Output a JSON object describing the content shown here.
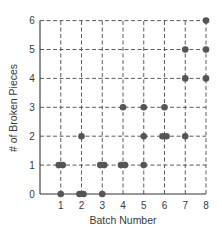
{
  "chart_data": {
    "type": "scatter",
    "title": "",
    "xlabel": "Batch Number",
    "ylabel": "# of Broken Pieces",
    "x_ticks": [
      1,
      2,
      3,
      4,
      5,
      6,
      7,
      8
    ],
    "y_ticks": [
      0,
      1,
      2,
      3,
      4,
      5,
      6
    ],
    "xlim": [
      0,
      8
    ],
    "ylim": [
      0,
      6
    ],
    "grid": true,
    "grid_style": "dashed",
    "legend": null,
    "marker_color": "#555555",
    "series": [
      {
        "name": "Broken pieces per trial",
        "points": [
          {
            "x": 1,
            "y": 0
          },
          {
            "x": 1,
            "y": 1
          },
          {
            "x": 1,
            "y": 1
          },
          {
            "x": 2,
            "y": 0
          },
          {
            "x": 2,
            "y": 0
          },
          {
            "x": 2,
            "y": 2
          },
          {
            "x": 3,
            "y": 0
          },
          {
            "x": 3,
            "y": 1
          },
          {
            "x": 3,
            "y": 1
          },
          {
            "x": 4,
            "y": 1
          },
          {
            "x": 4,
            "y": 1
          },
          {
            "x": 4,
            "y": 3
          },
          {
            "x": 5,
            "y": 1
          },
          {
            "x": 5,
            "y": 2
          },
          {
            "x": 5,
            "y": 3
          },
          {
            "x": 6,
            "y": 2
          },
          {
            "x": 6,
            "y": 2
          },
          {
            "x": 6,
            "y": 3
          },
          {
            "x": 7,
            "y": 2
          },
          {
            "x": 7,
            "y": 4
          },
          {
            "x": 7,
            "y": 5
          },
          {
            "x": 8,
            "y": 4
          },
          {
            "x": 8,
            "y": 5
          },
          {
            "x": 8,
            "y": 6
          }
        ]
      }
    ]
  }
}
